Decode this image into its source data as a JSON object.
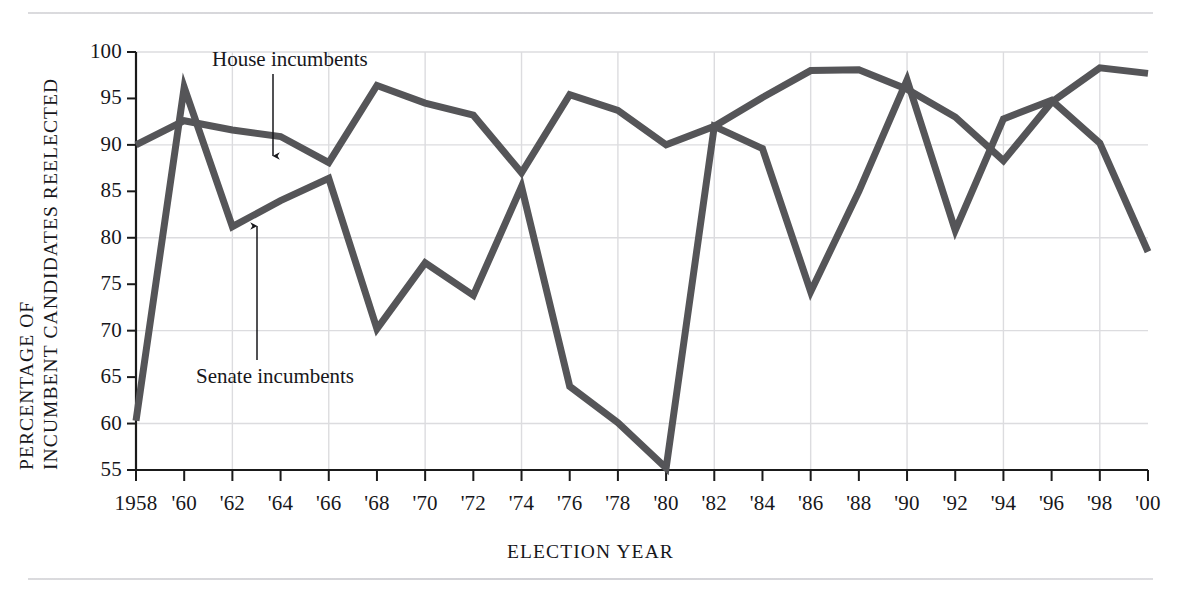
{
  "chart_data": {
    "type": "line",
    "title": "",
    "xlabel": "ELECTION YEAR",
    "ylabel": "PERCENTAGE OF INCUMBENT CANDIDATES REELECTED",
    "ylabel_line1": "PERCENTAGE OF",
    "ylabel_line2": "INCUMBENT CANDIDATES REELECTED",
    "ylim": [
      55,
      100
    ],
    "ytick_values": [
      55,
      60,
      65,
      70,
      75,
      80,
      85,
      90,
      95,
      100
    ],
    "ytick_labels": [
      "55",
      "60",
      "65",
      "70",
      "75",
      "80",
      "85",
      "90",
      "95",
      "100"
    ],
    "gridlines_y": [
      60,
      70,
      80,
      90,
      100
    ],
    "grid": true,
    "legend_position": "inline-annotations",
    "x": [
      1958,
      1960,
      1962,
      1964,
      1966,
      1968,
      1970,
      1972,
      1974,
      1976,
      1978,
      1980,
      1982,
      1984,
      1986,
      1988,
      1990,
      1992,
      1994,
      1996,
      1998,
      2000
    ],
    "categories": [
      "1958",
      "'60",
      "'62",
      "'64",
      "'66",
      "'68",
      "'70",
      "'72",
      "'74",
      "'76",
      "'78",
      "'80",
      "'82",
      "'84",
      "'86",
      "'88",
      "'90",
      "'92",
      "'94",
      "'96",
      "'98",
      "'00"
    ],
    "series": [
      {
        "name": "House incumbents",
        "color": "#555558",
        "values": [
          90.0,
          92.6,
          91.6,
          90.9,
          88.1,
          96.4,
          94.5,
          93.2,
          87.0,
          95.4,
          93.7,
          90.0,
          92.0,
          95.1,
          98.0,
          98.1,
          96.0,
          93.0,
          88.3,
          94.6,
          98.3,
          97.7
        ]
      },
      {
        "name": "Senate incumbents",
        "color": "#555558",
        "values": [
          60.3,
          96.2,
          81.2,
          84.0,
          86.4,
          70.2,
          77.3,
          73.8,
          85.5,
          64.0,
          60.1,
          55.2,
          92.0,
          89.6,
          74.2,
          85.0,
          97.0,
          80.8,
          92.8,
          94.8,
          90.2,
          78.5
        ]
      }
    ],
    "annotations": [
      {
        "text": "House incumbents",
        "points_to_series": "House incumbents",
        "points_to_x": 1964
      },
      {
        "text": "Senate incumbents",
        "points_to_series": "Senate incumbents",
        "points_to_x": 1962
      }
    ]
  }
}
